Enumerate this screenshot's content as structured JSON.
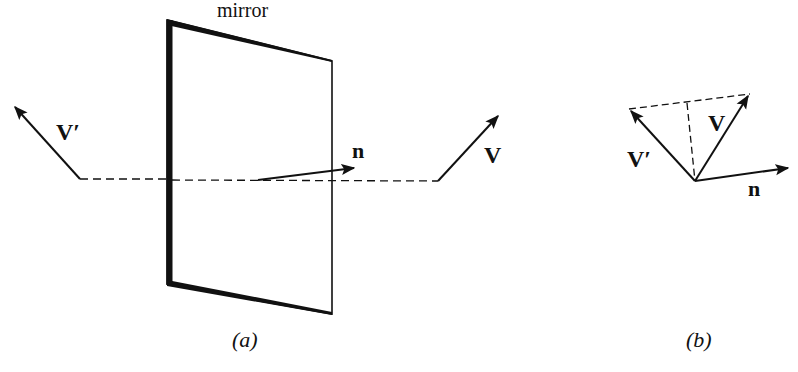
{
  "figure": {
    "panel_a": {
      "caption": "(a)",
      "mirror_label": "mirror",
      "vector_V_label": "V",
      "vector_V_prime_label": "V′",
      "normal_label": "n"
    },
    "panel_b": {
      "caption": "(b)",
      "vector_V_label": "V",
      "vector_V_prime_label": "V′",
      "normal_label": "n"
    },
    "colors": {
      "ink": "#111111",
      "background": "#ffffff"
    }
  }
}
